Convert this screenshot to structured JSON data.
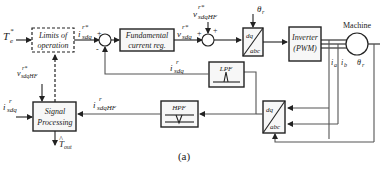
{
  "diagram": {
    "caption": "(a)",
    "blocks": {
      "limits": {
        "line1": "Limits of",
        "line2": "operation"
      },
      "current_reg": {
        "line1": "Fundamental",
        "line2": "current reg."
      },
      "dq_abc_top": {
        "top": "dq",
        "bottom": "abc"
      },
      "inverter": {
        "line1": "Inverter",
        "line2": "(PWM)"
      },
      "machine": {
        "label": "Machine"
      },
      "lpf": {
        "label": "LPF"
      },
      "hpf": {
        "label": "HPF"
      },
      "dq_abc_bottom": {
        "top": "dq",
        "bottom": "abc"
      },
      "signal_processing": {
        "line1": "Signal",
        "line2": "Processing"
      }
    },
    "signals": {
      "te_ref": "T",
      "te_ref_sub": "e",
      "te_ref_sup": "*",
      "i_sdq_ref": "i",
      "i_sdq_ref_sub": "sdq",
      "i_sdq_ref_sup": "r*",
      "v_sdq_ref": "v",
      "v_sdq_ref_sub": "sdq",
      "v_sdq_ref_sup": "r*",
      "v_hf_top": "v",
      "v_hf_top_sub": "sdqHF",
      "v_hf_top_sup": "r*",
      "theta_r_top": "θ",
      "theta_r_top_sub": "r",
      "i_sdq_fb": "i",
      "i_sdq_fb_sub": "sdq",
      "i_sdq_fb_sup": "r",
      "v_hf_left": "v",
      "v_hf_left_sub": "sdqHF",
      "v_hf_left_sup": "r*",
      "i_sdq_sp": "i",
      "i_sdq_sp_sub": "sdq",
      "i_sdq_sp_sup": "r",
      "i_hf": "i",
      "i_hf_sub": "sdqHF",
      "i_hf_sup": "r",
      "t_out": "T",
      "t_out_sub": "out",
      "t_out_hat": "^",
      "ia": "i",
      "ia_sub": "a",
      "ib": "i",
      "ib_sub": "b",
      "theta_r_right": "θ",
      "theta_r_right_sub": "r",
      "plus": "+",
      "minus": "-"
    }
  }
}
